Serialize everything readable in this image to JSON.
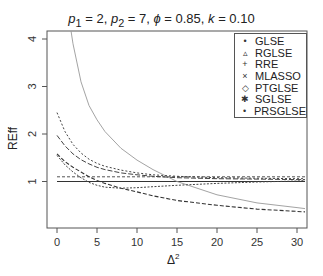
{
  "chart_data": {
    "type": "line",
    "xlabel": "Δ²",
    "ylabel": "REff",
    "xlim": [
      -1.25,
      31.25
    ],
    "ylim": [
      0.0,
      4.2
    ],
    "xticks": [
      0,
      5,
      10,
      15,
      20,
      25,
      30
    ],
    "yticks": [
      1,
      2,
      3,
      4
    ],
    "grid": false,
    "legend_position": "top-right",
    "x": [
      0,
      1,
      2,
      3,
      4,
      5,
      6,
      8,
      10,
      12,
      15,
      20,
      25,
      30,
      31
    ],
    "series": [
      {
        "name": "GLSE",
        "marker": "•",
        "values": [
          1.0,
          1.0,
          1.0,
          1.0,
          1.0,
          1.0,
          1.0,
          1.0,
          1.0,
          1.0,
          1.0,
          1.0,
          1.0,
          1.0,
          1.0
        ]
      },
      {
        "name": "RGLSE",
        "marker": "▵",
        "values": [
          1.1,
          1.1,
          1.1,
          1.1,
          1.1,
          1.1,
          1.1,
          1.1,
          1.1,
          1.1,
          1.1,
          1.1,
          1.1,
          1.1,
          1.1
        ]
      },
      {
        "name": "RRE",
        "marker": "+",
        "values": [
          6.5,
          5.0,
          3.9,
          3.1,
          2.6,
          2.3,
          2.05,
          1.7,
          1.45,
          1.25,
          1.0,
          0.72,
          0.55,
          0.45,
          0.43
        ]
      },
      {
        "name": "MLASSO",
        "marker": "×",
        "values": [
          1.58,
          1.42,
          1.3,
          1.2,
          1.1,
          1.02,
          0.96,
          0.86,
          0.78,
          0.7,
          0.6,
          0.5,
          0.42,
          0.37,
          0.36
        ]
      },
      {
        "name": "PTGLSE",
        "marker": "◇",
        "values": [
          1.55,
          1.35,
          1.2,
          1.08,
          0.98,
          0.92,
          0.88,
          0.86,
          0.87,
          0.89,
          0.92,
          0.96,
          0.99,
          1.01,
          1.02
        ]
      },
      {
        "name": "SGLSE",
        "marker": "✱",
        "values": [
          2.45,
          2.05,
          1.78,
          1.6,
          1.47,
          1.38,
          1.32,
          1.24,
          1.18,
          1.14,
          1.11,
          1.08,
          1.07,
          1.06,
          1.06
        ]
      },
      {
        "name": "PRSGLSE",
        "marker": "•",
        "values": [
          1.97,
          1.75,
          1.58,
          1.46,
          1.37,
          1.3,
          1.25,
          1.18,
          1.14,
          1.11,
          1.08,
          1.06,
          1.05,
          1.04,
          1.04
        ]
      }
    ]
  },
  "title_parts": {
    "p1": "p",
    "p1_sub": "1",
    "p1_val": " = 2, ",
    "p2": "p",
    "p2_sub": "2",
    "p2_val": " = 7, ",
    "phi": "ϕ",
    "phi_val": " = 0.85, ",
    "k": "k",
    "k_val": " = 0.10"
  },
  "axes": {
    "xlabel": "Δ",
    "xlabel_sup": "2",
    "ylabel": "REff"
  },
  "legend": {
    "items": [
      {
        "label": "GLSE",
        "glyph": "•"
      },
      {
        "label": "RGLSE",
        "glyph": "▵"
      },
      {
        "label": "RRE",
        "glyph": "+"
      },
      {
        "label": "MLASSO",
        "glyph": "×"
      },
      {
        "label": "PTGLSE",
        "glyph": "◇"
      },
      {
        "label": "SGLSE",
        "glyph": "✱"
      },
      {
        "label": "PRSGLSE",
        "glyph": "•"
      }
    ]
  },
  "styles": {
    "GLSE": {
      "color": "#333333",
      "dash": "",
      "width": 1.1
    },
    "RGLSE": {
      "color": "#555555",
      "dash": "3,2",
      "width": 1
    },
    "RRE": {
      "color": "#999999",
      "dash": "",
      "width": 0.9
    },
    "MLASSO": {
      "color": "#333333",
      "dash": "4,2",
      "width": 1.1
    },
    "PTGLSE": {
      "color": "#444444",
      "dash": "2,1.5",
      "width": 1
    },
    "SGLSE": {
      "color": "#444444",
      "dash": "2,2",
      "width": 1
    },
    "PRSGLSE": {
      "color": "#444444",
      "dash": "5,2",
      "width": 1
    }
  }
}
